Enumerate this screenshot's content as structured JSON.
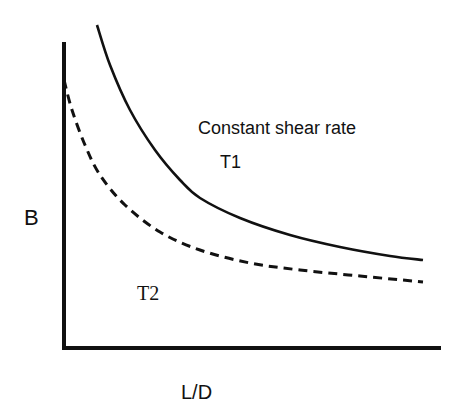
{
  "chart_data": {
    "type": "line",
    "title": "",
    "xlabel": "L/D",
    "ylabel": "B",
    "annotation": "Constant shear rate",
    "grid": false,
    "ticks": "none",
    "series": [
      {
        "name": "T1",
        "style": "solid",
        "color": "#111111",
        "points_px": [
          [
            97,
            25
          ],
          [
            110,
            65
          ],
          [
            130,
            110
          ],
          [
            155,
            150
          ],
          [
            180,
            180
          ],
          [
            200,
            198
          ],
          [
            240,
            218
          ],
          [
            290,
            235
          ],
          [
            340,
            247
          ],
          [
            390,
            256
          ],
          [
            423,
            260
          ]
        ]
      },
      {
        "name": "T2",
        "style": "dashed",
        "color": "#111111",
        "points_px": [
          [
            64,
            80
          ],
          [
            72,
            110
          ],
          [
            85,
            145
          ],
          [
            100,
            175
          ],
          [
            125,
            205
          ],
          [
            160,
            232
          ],
          [
            200,
            250
          ],
          [
            250,
            263
          ],
          [
            300,
            270
          ],
          [
            360,
            276
          ],
          [
            423,
            282
          ]
        ]
      }
    ]
  },
  "labels": {
    "annotation": "Constant shear rate",
    "t1": "T1",
    "t2": "T2",
    "y_axis": "B",
    "x_axis": "L/D"
  }
}
